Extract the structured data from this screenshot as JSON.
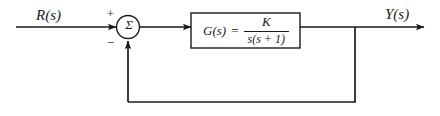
{
  "diagram": {
    "type": "control-system-block-diagram",
    "line_color": "#1a1a1a",
    "background_color": "#ffffff",
    "input": {
      "label": "R(s)",
      "name": "reference-input"
    },
    "output": {
      "label": "Y(s)",
      "name": "output-signal"
    },
    "summing_junction": {
      "symbol": "Σ",
      "positive_sign": "+",
      "negative_sign": "−",
      "positive_input": "R(s)",
      "negative_input": "Y(s)"
    },
    "plant_block": {
      "lhs": "G(s)",
      "equals": "=",
      "numerator": "K",
      "denominator": "s(s + 1)",
      "transfer_function": "G(s) = K / (s(s + 1))"
    },
    "feedback": {
      "path": "unity",
      "gain": "1",
      "takeoff_label": "Y(s)"
    }
  }
}
